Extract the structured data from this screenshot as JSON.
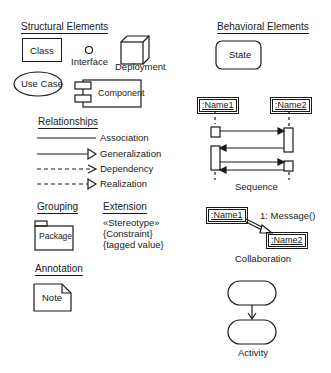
{
  "structural": {
    "heading": "Structural Elements",
    "class_label": "Class",
    "interface_label": "Interface",
    "deployment_label": "Deployment",
    "usecase_label": "Use Case",
    "component_label": "Component"
  },
  "relationships": {
    "heading": "Relationships",
    "items": [
      {
        "label": "Association",
        "line": "solid",
        "head": "none"
      },
      {
        "label": "Generalization",
        "line": "solid",
        "head": "hollow-triangle"
      },
      {
        "label": "Dependency",
        "line": "dashed",
        "head": "open-arrow"
      },
      {
        "label": "Realization",
        "line": "dashed",
        "head": "hollow-triangle"
      }
    ]
  },
  "grouping": {
    "heading": "Grouping",
    "package_label": "Package"
  },
  "extension": {
    "heading": "Extension",
    "lines": [
      "«Stereotype»",
      "{Constraint}",
      "{tagged value}"
    ]
  },
  "annotation": {
    "heading": "Annotation",
    "note_label": "Note"
  },
  "behavioral": {
    "heading": "Behavioral Elements",
    "state_label": "State",
    "sequence": {
      "object1": ":Name1",
      "object2": ":Name2",
      "caption": "Sequence"
    },
    "collaboration": {
      "object1": ":Name1",
      "object2": ":Name2",
      "message": "1: Message()",
      "caption": "Collaboration"
    },
    "activity": {
      "caption": "Activity"
    }
  },
  "colors": {
    "ink": "#1a1a1a",
    "background": "#ffffff"
  }
}
